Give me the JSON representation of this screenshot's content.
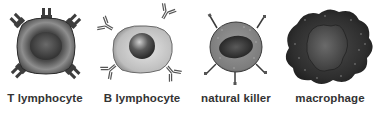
{
  "diagram": {
    "cells": [
      {
        "name": "T lymphocyte",
        "label": "T lymphocyte",
        "icon": "t-lymphocyte-icon"
      },
      {
        "name": "B lymphocyte",
        "label": "B lymphocyte",
        "icon": "b-lymphocyte-icon"
      },
      {
        "name": "natural killer",
        "label": "natural killer",
        "icon": "natural-killer-icon"
      },
      {
        "name": "macrophage",
        "label": "macrophage",
        "icon": "macrophage-icon"
      }
    ],
    "colors": {
      "background": "#ffffff",
      "text": "#333333",
      "t_cell_body": "#5a5a5a",
      "b_cell_body": "#c8c8c8",
      "nk_body": "#8a8a8a",
      "macrophage_body": "#2a2a2a"
    }
  }
}
